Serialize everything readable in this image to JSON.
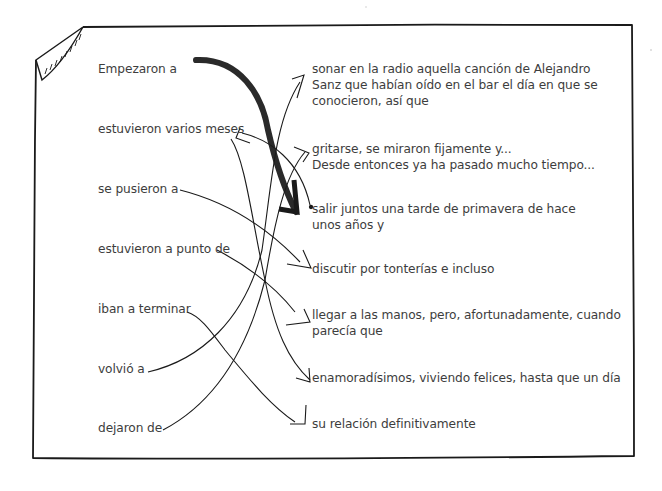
{
  "exercise": {
    "type": "sentence-matching",
    "left_column": [
      {
        "id": "L1",
        "text": "Empezaron a"
      },
      {
        "id": "L2",
        "text": "estuvieron varios meses"
      },
      {
        "id": "L3",
        "text": "se pusieron a"
      },
      {
        "id": "L4",
        "text": "estuvieron a punto de"
      },
      {
        "id": "L5",
        "text": "iban a terminar"
      },
      {
        "id": "L6",
        "text": "volvió a"
      },
      {
        "id": "L7",
        "text": "dejaron de"
      }
    ],
    "right_column": [
      {
        "id": "R1",
        "lines": [
          "sonar en la radio aquella canción de Alejandro",
          "Sanz que habían oído en el bar el día en que se",
          "conocieron, así que"
        ]
      },
      {
        "id": "R2",
        "lines": [
          "gritarse, se miraron fijamente y...",
          "Desde entonces ya ha pasado mucho tiempo..."
        ]
      },
      {
        "id": "R3",
        "lines": [
          "salir juntos una tarde de primavera de hace",
          "unos años y"
        ]
      },
      {
        "id": "R4",
        "lines": [
          "discutir por tonterías e incluso"
        ]
      },
      {
        "id": "R5",
        "lines": [
          "llegar a las manos, pero, afortunadamente, cuando",
          "parecía que"
        ]
      },
      {
        "id": "R6",
        "lines": [
          "enamoradísimos, viviendo felices, hasta que un día"
        ]
      },
      {
        "id": "R7",
        "lines": [
          "su relación definitivamente"
        ]
      }
    ],
    "connections": [
      {
        "from": "L1",
        "to": "R3",
        "style": "bold-arrow"
      },
      {
        "from": "L2",
        "to": "R6"
      },
      {
        "from": "L2",
        "to": "R3"
      },
      {
        "from": "L3",
        "to": "R4"
      },
      {
        "from": "L4",
        "to": "R5"
      },
      {
        "from": "L5",
        "to": "R7"
      },
      {
        "from": "L6",
        "to": "R1"
      },
      {
        "from": "L7",
        "to": "R2"
      }
    ],
    "colors": {
      "ink": "#1a1a1a",
      "text": "#3d3d3d",
      "paper": "#ffffff"
    }
  }
}
